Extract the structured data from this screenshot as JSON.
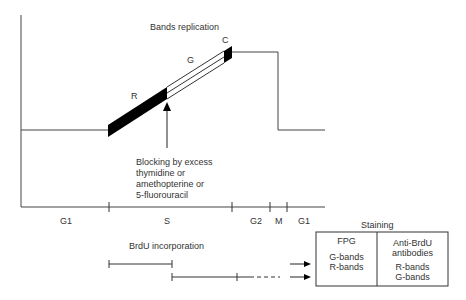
{
  "diagram": {
    "title_bands": "Bands replication",
    "band_labels": {
      "r": "R",
      "g": "G",
      "c": "C"
    },
    "blocking_text": [
      "Blocking by excess",
      "thymidine or",
      "amethopterine or",
      "5-fluorouracil"
    ],
    "phases": [
      "G1",
      "S",
      "G2",
      "M",
      "G1"
    ],
    "brdu_label": "BrdU incorporation",
    "staining": {
      "title": "Staining",
      "columns": [
        {
          "header": [
            "FPG"
          ],
          "rows": [
            "G-bands",
            "R-bands"
          ]
        },
        {
          "header": [
            "Anti-BrdU",
            "antibodies"
          ],
          "rows": [
            "R-bands",
            "G-bands"
          ]
        }
      ]
    },
    "colors": {
      "line": "#333333",
      "fill": "#000000",
      "text": "#333333",
      "background": "#ffffff"
    }
  }
}
